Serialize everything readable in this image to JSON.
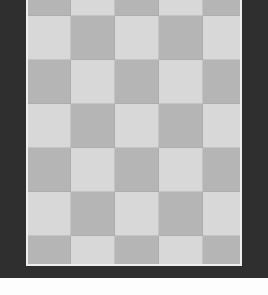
{
  "board": {
    "type": "checkerboard",
    "visible_columns": 5,
    "visible_rows": 7,
    "square_size_px": 44,
    "offset_x_px": -1,
    "offset_y_px": -28,
    "first_square_shade": "dark",
    "colors": {
      "dark_square": "#b5b5b5",
      "light_square": "#d8d8d8",
      "frame": "#2f2f2f",
      "frame_inner_line": "#eeeeee",
      "page_background": "#fdfdfd"
    },
    "pieces": []
  }
}
